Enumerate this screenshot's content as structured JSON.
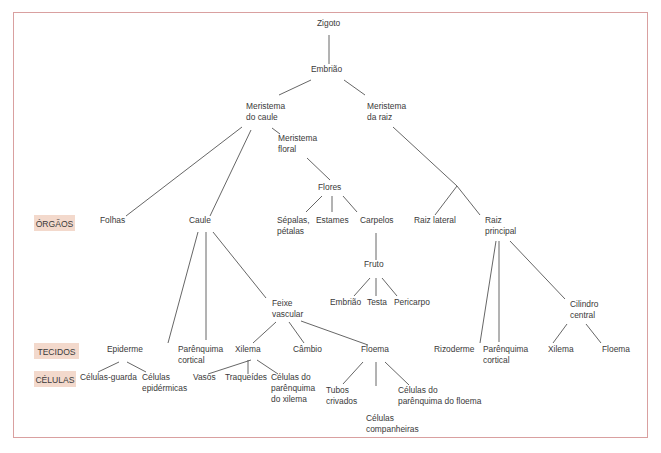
{
  "colors": {
    "frame": "#d9a0a0",
    "level_box": "#f3d9cc",
    "text": "#3a3a3a",
    "line": "#555555"
  },
  "levels": [
    {
      "id": "orgaos",
      "label": "ÓRGÃOS",
      "x": 34,
      "y": 215,
      "w": 41,
      "h": 16
    },
    {
      "id": "tecidos",
      "label": "TECIDOS",
      "x": 34,
      "y": 343,
      "w": 45,
      "h": 16
    },
    {
      "id": "celulas",
      "label": "CÉLULAS",
      "x": 34,
      "y": 371,
      "w": 42,
      "h": 16
    }
  ],
  "nodes": [
    {
      "id": "zigoto",
      "lines": [
        "Zigoto"
      ],
      "x": 317,
      "y": 26
    },
    {
      "id": "embriao",
      "lines": [
        "Embrião"
      ],
      "x": 311,
      "y": 72
    },
    {
      "id": "meristema-caule",
      "lines": [
        "Meristema",
        "do caule"
      ],
      "x": 246,
      "y": 109
    },
    {
      "id": "meristema-raiz",
      "lines": [
        "Meristema",
        "da raiz"
      ],
      "x": 367,
      "y": 109
    },
    {
      "id": "meristema-floral",
      "lines": [
        "Meristema",
        "floral"
      ],
      "x": 278,
      "y": 141
    },
    {
      "id": "flores",
      "lines": [
        "Flores"
      ],
      "x": 318,
      "y": 190
    },
    {
      "id": "folhas",
      "lines": [
        "Folhas"
      ],
      "x": 100,
      "y": 223
    },
    {
      "id": "caule",
      "lines": [
        "Caule"
      ],
      "x": 189,
      "y": 223
    },
    {
      "id": "sepalas-petalas",
      "lines": [
        "Sépalas,",
        "pétalas"
      ],
      "x": 277,
      "y": 223
    },
    {
      "id": "estames",
      "lines": [
        "Estames"
      ],
      "x": 316,
      "y": 223
    },
    {
      "id": "carpelos",
      "lines": [
        "Carpelos"
      ],
      "x": 360,
      "y": 223
    },
    {
      "id": "raiz-lateral",
      "lines": [
        "Raiz lateral"
      ],
      "x": 414,
      "y": 223
    },
    {
      "id": "raiz-principal",
      "lines": [
        "Raiz",
        "principal"
      ],
      "x": 485,
      "y": 223
    },
    {
      "id": "fruto",
      "lines": [
        "Fruto"
      ],
      "x": 364,
      "y": 267
    },
    {
      "id": "embriao-2",
      "lines": [
        "Embrião"
      ],
      "x": 330,
      "y": 305
    },
    {
      "id": "testa",
      "lines": [
        "Testa"
      ],
      "x": 367,
      "y": 305
    },
    {
      "id": "pericarpo",
      "lines": [
        "Pericarpo"
      ],
      "x": 394,
      "y": 305
    },
    {
      "id": "feixe-vascular",
      "lines": [
        "Feixe",
        "vascular"
      ],
      "x": 272,
      "y": 306
    },
    {
      "id": "cilindro-central",
      "lines": [
        "Cilindro",
        "central"
      ],
      "x": 570,
      "y": 307
    },
    {
      "id": "epiderme",
      "lines": [
        "Epiderme"
      ],
      "x": 107,
      "y": 352
    },
    {
      "id": "parenquima-cortical",
      "lines": [
        "Parênquima",
        "cortical"
      ],
      "x": 178,
      "y": 352
    },
    {
      "id": "xilema",
      "lines": [
        "Xilema"
      ],
      "x": 235,
      "y": 352
    },
    {
      "id": "cambio",
      "lines": [
        "Câmbio"
      ],
      "x": 293,
      "y": 352
    },
    {
      "id": "floema",
      "lines": [
        "Floema"
      ],
      "x": 361,
      "y": 352
    },
    {
      "id": "rizoderme",
      "lines": [
        "Rizoderme"
      ],
      "x": 434,
      "y": 352
    },
    {
      "id": "parenquima-cortical-raiz",
      "lines": [
        "Parênquima",
        "cortical"
      ],
      "x": 483,
      "y": 352
    },
    {
      "id": "xilema-raiz",
      "lines": [
        "Xilema"
      ],
      "x": 548,
      "y": 352
    },
    {
      "id": "floema-raiz",
      "lines": [
        "Floema"
      ],
      "x": 602,
      "y": 352
    },
    {
      "id": "celulas-guarda",
      "lines": [
        "Células-guarda"
      ],
      "x": 80,
      "y": 380
    },
    {
      "id": "celulas-epidermicas",
      "lines": [
        "Células",
        "epidérmicas"
      ],
      "x": 142,
      "y": 380
    },
    {
      "id": "vasos",
      "lines": [
        "Vasos"
      ],
      "x": 193,
      "y": 380
    },
    {
      "id": "traqueides",
      "lines": [
        "Traqueídes"
      ],
      "x": 225,
      "y": 380
    },
    {
      "id": "celulas-parenquima-xilema",
      "lines": [
        "Células do",
        "parênquima",
        "do xilema"
      ],
      "x": 271,
      "y": 380
    },
    {
      "id": "tubos-crivados",
      "lines": [
        "Tubos",
        "crivados"
      ],
      "x": 326,
      "y": 393
    },
    {
      "id": "celulas-parenquima-floema",
      "lines": [
        "Células do",
        "parênquima do floema"
      ],
      "x": 398,
      "y": 393
    },
    {
      "id": "celulas-companheiras",
      "lines": [
        "Células",
        "companheiras"
      ],
      "x": 366,
      "y": 421
    }
  ],
  "edges": [
    [
      329,
      35,
      329,
      64
    ],
    [
      311,
      80,
      279,
      95
    ],
    [
      344,
      80,
      365,
      95
    ],
    [
      242,
      127,
      126,
      216
    ],
    [
      251,
      130,
      210,
      216
    ],
    [
      272,
      128,
      280,
      134
    ],
    [
      307,
      158,
      330,
      180
    ],
    [
      322,
      196,
      306,
      212
    ],
    [
      332,
      196,
      332,
      212
    ],
    [
      343,
      196,
      357,
      212
    ],
    [
      393,
      127,
      457,
      186
    ],
    [
      457,
      186,
      480,
      215
    ],
    [
      457,
      186,
      435,
      215
    ],
    [
      376,
      233,
      376,
      260
    ],
    [
      370,
      278,
      354,
      296
    ],
    [
      376,
      278,
      376,
      296
    ],
    [
      382,
      278,
      397,
      296
    ],
    [
      198,
      232,
      168,
      343
    ],
    [
      206,
      232,
      206,
      340
    ],
    [
      213,
      232,
      266,
      298
    ],
    [
      276,
      322,
      253,
      343
    ],
    [
      289,
      322,
      304,
      343
    ],
    [
      301,
      321,
      368,
      345
    ],
    [
      496,
      241,
      480,
      343
    ],
    [
      499,
      241,
      499,
      342
    ],
    [
      510,
      241,
      565,
      299
    ],
    [
      567,
      324,
      553,
      343
    ],
    [
      586,
      324,
      601,
      343
    ],
    [
      119,
      362,
      98,
      372
    ],
    [
      127,
      362,
      146,
      372
    ],
    [
      251,
      360,
      208,
      374
    ],
    [
      248,
      360,
      248,
      374
    ],
    [
      257,
      360,
      278,
      374
    ],
    [
      363,
      362,
      343,
      384
    ],
    [
      376,
      362,
      376,
      386
    ],
    [
      385,
      362,
      409,
      385
    ]
  ]
}
